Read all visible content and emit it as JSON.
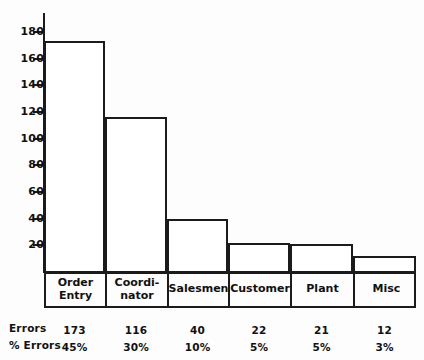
{
  "chart_data": {
    "type": "bar",
    "title": "",
    "subtitle": "",
    "xlabel": "",
    "ylabel": "",
    "categories": [
      "Order\nEntry",
      "Coordi-\nnator",
      "Salesmen",
      "Customer",
      "Plant",
      "Misc"
    ],
    "values": [
      173,
      116,
      40,
      22,
      21,
      12
    ],
    "percents": [
      "45%",
      "30%",
      "10%",
      "5%",
      "5%",
      "3%"
    ],
    "percent_values": [
      45,
      30,
      10,
      5,
      5,
      3
    ],
    "ylim": [
      0,
      190
    ],
    "yticks": [
      20,
      40,
      60,
      80,
      100,
      120,
      140,
      160,
      180
    ],
    "ytick_labels": [
      "20",
      "40",
      "60",
      "80",
      "100",
      "120",
      "140",
      "160",
      "180"
    ],
    "grid": false,
    "legend": "none",
    "bar_widths": [
      60,
      62,
      61,
      62,
      63,
      62
    ],
    "series": [
      {
        "name": "Errors",
        "values": [
          173,
          116,
          40,
          22,
          21,
          12
        ]
      },
      {
        "name": "% Errors",
        "values": [
          45,
          30,
          10,
          5,
          5,
          3
        ]
      }
    ]
  },
  "table": {
    "rows": [
      {
        "label": "Errors",
        "cells": [
          "173",
          "116",
          "40",
          "22",
          "21",
          "12"
        ]
      },
      {
        "label": "% Errors",
        "cells": [
          "45%",
          "30%",
          "10%",
          "5%",
          "5%",
          "3%"
        ]
      }
    ]
  },
  "colors": {
    "ink": "#1b1b1b",
    "text": "#111111",
    "background": "#fdfdfd",
    "bar_fill": "#ffffff"
  }
}
